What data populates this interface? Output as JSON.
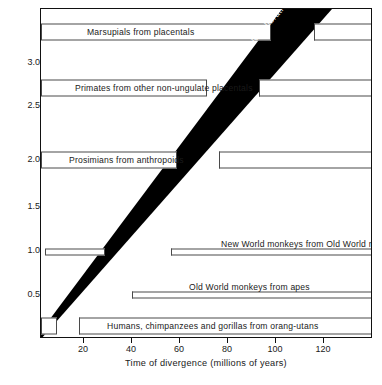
{
  "chart_data": {
    "type": "bar",
    "title": "",
    "xlabel": "Time of divergence  (millions of years)",
    "ylabel": "Albumin, transferrin, plus DNA distance",
    "xlim": [
      0,
      138
    ],
    "ylim": [
      0,
      3.45
    ],
    "grid": false,
    "legend": null,
    "x_ticks": [
      20,
      40,
      60,
      80,
      100,
      120
    ],
    "x_tick_labels": [
      "20",
      "40",
      "60",
      "80",
      "100",
      "120"
    ],
    "y_ticks": [
      0.5,
      1.0,
      1.5,
      2.0,
      2.5,
      3.0
    ],
    "y_tick_labels": [
      "0.5",
      "1.0",
      "1.5",
      "2.0",
      "2.5",
      "3.0"
    ],
    "annotations": [
      {
        "name": "possible-calibration-range",
        "text": "Possible calibration range",
        "kind": "diagonal-band",
        "x_start": 0,
        "y_start": 0,
        "x_end_lower": 121,
        "x_end_upper": 100,
        "color": "#000000",
        "text_color": "#ffffff"
      }
    ],
    "series": [
      {
        "name": "Marsupials from placentals",
        "label": "Marsupials from placentals",
        "y": 3.25,
        "x_known_range": [
          0,
          96
        ],
        "x_uncertain_range": [
          114,
          138
        ],
        "label_x": 46,
        "label_anchor": "middle"
      },
      {
        "name": "Primates from other non-ungulate placentals",
        "label": "Primates from other non-ungulate placentals",
        "y": 2.72,
        "x_known_range": [
          0,
          68
        ],
        "x_uncertain_range": [
          90,
          138
        ],
        "label_x": 34,
        "label_anchor": "middle"
      },
      {
        "name": "Prosimians from anthropoids",
        "label": "Prosimians from anthropoids",
        "y": 2.0,
        "x_known_range": [
          0,
          56
        ],
        "x_uncertain_range": [
          74,
          138
        ],
        "label_x": 28,
        "label_anchor": "middle"
      },
      {
        "name": "New World monkeys from Old World monkeys",
        "label": "New World monkeys from Old World monkeys",
        "y": 0.98,
        "x_known_range": [
          2,
          28
        ],
        "x_uncertain_range": [
          58,
          138
        ],
        "label_x": 98,
        "label_anchor": "middle",
        "thin": true
      },
      {
        "name": "Old World monkeys from apes",
        "label": "Old World monkeys from apes",
        "y": 0.55,
        "x_known_range": null,
        "x_uncertain_range": [
          41,
          138
        ],
        "label_x": 90,
        "label_anchor": "middle",
        "thin": true
      },
      {
        "name": "Humans, chimpanzees and gorillas from orang-utans",
        "label": "Humans, chimpanzees and gorillas from orang-utans",
        "y": 0.18,
        "x_known_range": [
          0,
          6
        ],
        "x_uncertain_range": [
          18,
          138
        ],
        "label_x": 78,
        "label_anchor": "middle"
      }
    ]
  },
  "axes": {
    "y_title": "Albumin, transferrin, plus DNA distance",
    "x_title": "Time of divergence  (millions of years)"
  },
  "bars": {
    "marsupials": {
      "label": "Marsupials from placentals"
    },
    "primates": {
      "label": "Primates from other non-ungulate placentals"
    },
    "prosimians": {
      "label": "Prosimians from anthropoids"
    },
    "new_world": {
      "label": "New World monkeys from Old World monkeys"
    },
    "old_world": {
      "label": "Old World monkeys from apes"
    },
    "humans": {
      "label": "Humans, chimpanzees and gorillas from orang-utans"
    }
  },
  "band": {
    "label": "Possible calibration range"
  }
}
